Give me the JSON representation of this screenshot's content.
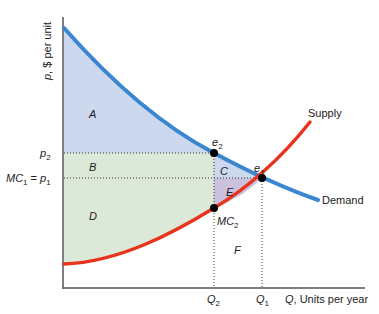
{
  "axes": {
    "y_label": "p, $ per unit",
    "x_label": "Q, Units per year"
  },
  "curves": {
    "demand": {
      "label": "Demand",
      "color": "#3a86d0"
    },
    "supply": {
      "label": "Supply",
      "color": "#e8341c"
    }
  },
  "ticks": {
    "p2": "p2",
    "p1": "MC1 = p1",
    "q2": "Q2",
    "q1": "Q1"
  },
  "points": {
    "e1": "e1",
    "e2": "e2",
    "mc2": "MC2"
  },
  "areas": {
    "A": "A",
    "B": "B",
    "C": "C",
    "D": "D",
    "E": "E",
    "F": "F"
  },
  "colors": {
    "area_blue": "#cbd8ee",
    "area_green": "#dce8d8",
    "area_purple": "#cbc3de"
  }
}
